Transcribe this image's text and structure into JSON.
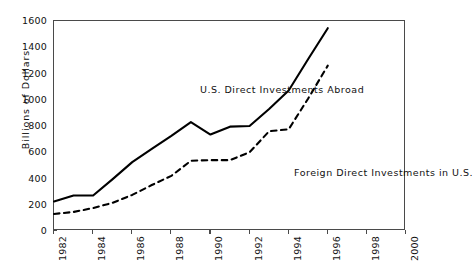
{
  "chart_data": {
    "type": "line",
    "title": "",
    "xlabel": "",
    "ylabel": "Billions  of  Dollars",
    "xlim": [
      1982,
      2000
    ],
    "ylim": [
      0,
      1600
    ],
    "xticks": [
      1982,
      1984,
      1986,
      1988,
      1990,
      1992,
      1994,
      1996,
      1998,
      2000
    ],
    "yticks": [
      0,
      200,
      400,
      600,
      800,
      1000,
      1200,
      1400,
      1600
    ],
    "grid": false,
    "legend_position": "inline-annotations",
    "x": [
      1982,
      1983,
      1984,
      1985,
      1986,
      1987,
      1988,
      1989,
      1990,
      1991,
      1992,
      1993,
      1994,
      1995,
      1996
    ],
    "series": [
      {
        "name": "U.S. Direct Investments Abroad",
        "style": "solid",
        "color": "#000000",
        "values": [
          225,
          270,
          270,
          395,
          525,
          625,
          725,
          830,
          735,
          795,
          800,
          930,
          1070,
          1310,
          1545
        ]
      },
      {
        "name": "Foreign Direct Investments in U.S.",
        "style": "dashed",
        "color": "#000000",
        "values": [
          130,
          145,
          175,
          215,
          275,
          350,
          420,
          535,
          540,
          540,
          600,
          760,
          775,
          1010,
          1260
        ]
      }
    ],
    "annotations": [
      {
        "text": "U.S. Direct Investments Abroad",
        "x": 1988.3,
        "y": 1160
      },
      {
        "text": "Foreign Direct Investments in U.S.",
        "x": 1991.6,
        "y": 525
      }
    ]
  },
  "axis": {
    "y_title": "Billions  of  Dollars",
    "y_tick_labels": [
      "1600",
      "1400",
      "1200",
      "1000",
      "800",
      "600",
      "400",
      "200",
      "0"
    ],
    "x_tick_labels": [
      "1982",
      "1984",
      "1986",
      "1988",
      "1990",
      "1992",
      "1994",
      "1996",
      "1998",
      "2000"
    ]
  },
  "notes": {
    "us_abroad": "U.S. Direct Investments Abroad",
    "foreign_in_us": "Foreign Direct Investments in U.S."
  },
  "colors": {
    "line": "#000000",
    "axis": "#4a4a4a",
    "text": "#111111",
    "background": "#ffffff"
  }
}
